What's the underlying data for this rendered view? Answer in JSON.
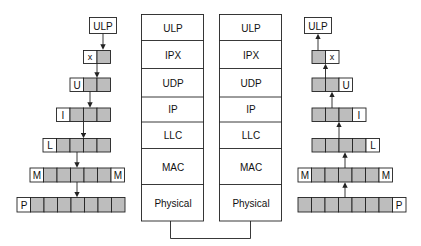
{
  "diagram": {
    "stacks": [
      {
        "id": "left-stack",
        "layers": [
          "ULP",
          "IPX",
          "UDP",
          "IP",
          "LLC",
          "MAC",
          "Physical"
        ]
      },
      {
        "id": "right-stack",
        "layers": [
          "ULP",
          "IPX",
          "UDP",
          "IP",
          "LLC",
          "MAC",
          "Physical"
        ]
      }
    ],
    "encapsulation_left": {
      "direction": "down",
      "rows": [
        {
          "header": "ULP",
          "gray_cells": 0
        },
        {
          "header": "x",
          "gray_cells": 1
        },
        {
          "header": "U",
          "gray_cells": 2
        },
        {
          "header": "I",
          "gray_cells": 3
        },
        {
          "header": "L",
          "gray_cells": 4
        },
        {
          "header": "M",
          "gray_cells": 5,
          "trailer": "M"
        },
        {
          "header": "P",
          "gray_cells": 7
        }
      ]
    },
    "encapsulation_right": {
      "direction": "up",
      "rows": [
        {
          "header": "ULP",
          "gray_cells": 0
        },
        {
          "header": "x",
          "gray_cells": 1
        },
        {
          "header": "U",
          "gray_cells": 2
        },
        {
          "header": "I",
          "gray_cells": 3
        },
        {
          "header": "L",
          "gray_cells": 4
        },
        {
          "header": "M",
          "gray_cells": 5,
          "trailer": "M"
        },
        {
          "header": "P",
          "gray_cells": 7
        }
      ]
    },
    "colors": {
      "cell_fill": "#bdbdbd",
      "border": "#222222",
      "background": "#ffffff"
    }
  }
}
